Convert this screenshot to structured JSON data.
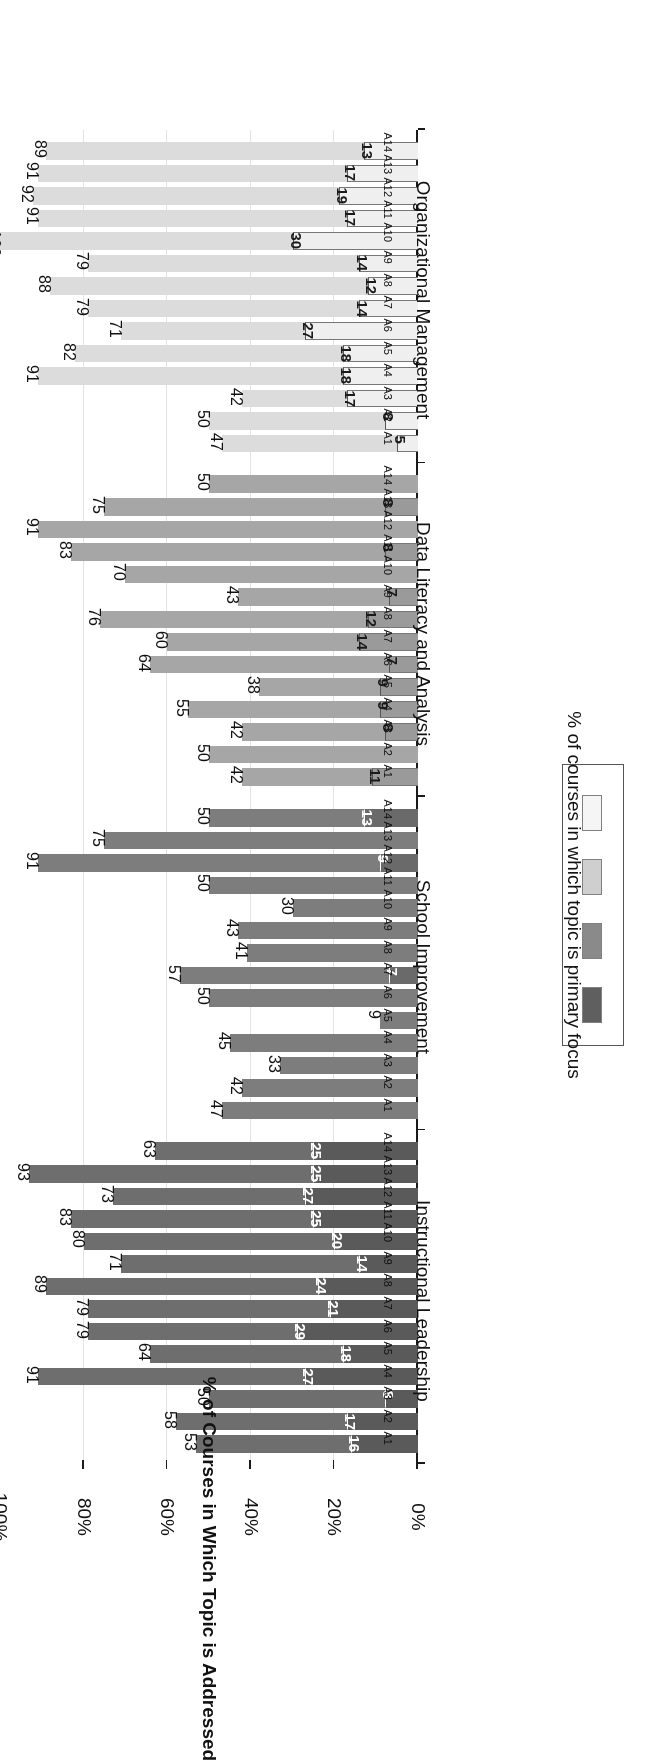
{
  "chart_data": {
    "type": "bar",
    "orientation": "horizontal-grouped",
    "title": "",
    "xlabel": "",
    "ylabel": "% of Courses in Which Topic is Addressed",
    "ylim": [
      0,
      100
    ],
    "ticks": [
      "0%",
      "20%",
      "40%",
      "60%",
      "80%",
      "100%"
    ],
    "tick_values": [
      0,
      20,
      40,
      60,
      80,
      100
    ],
    "grid": true,
    "legend_position": "bottom-right",
    "legend_title": "% of courses in which topic is primary focus",
    "categories": [
      "A1",
      "A2",
      "A3",
      "A4",
      "A5",
      "A6",
      "A7",
      "A8",
      "A9",
      "A10",
      "A11",
      "A12",
      "A13",
      "A14"
    ],
    "groups": [
      {
        "name": "Instructional Leadership",
        "color": "#6e6e6e",
        "inner_color": "#5a5a5a",
        "label_color": "#ffffff",
        "categories": [
          "A1",
          "A2",
          "A3",
          "A4",
          "A5",
          "A6",
          "A7",
          "A8",
          "A9",
          "A10",
          "A11",
          "A12",
          "A13",
          "A14"
        ],
        "values": [
          53,
          58,
          50,
          91,
          64,
          79,
          79,
          89,
          71,
          80,
          83,
          73,
          93,
          63
        ],
        "inner_values": [
          16,
          17,
          8,
          27,
          18,
          29,
          21,
          24,
          14,
          20,
          25,
          27,
          25,
          25
        ]
      },
      {
        "name": "School Improvement",
        "color": "#7d7d7d",
        "inner_color": "#6a6a6a",
        "label_color": "#ffffff",
        "categories": [
          "A1",
          "A2",
          "A3",
          "A4",
          "A5",
          "A6",
          "A7",
          "A8",
          "A9",
          "A10",
          "A11",
          "A12",
          "A13",
          "A14"
        ],
        "values": [
          47,
          42,
          33,
          45,
          9,
          50,
          57,
          41,
          43,
          30,
          50,
          91,
          75,
          50
        ],
        "inner_values": [
          0,
          0,
          0,
          0,
          0,
          0,
          7,
          0,
          0,
          0,
          0,
          9,
          0,
          13
        ]
      },
      {
        "name": "Data Literacy and Analysis",
        "color": "#a6a6a6",
        "inner_color": "#9a9a9a",
        "label_color": "#1a1a1a",
        "categories": [
          "A1",
          "A2",
          "A3",
          "A4",
          "A5",
          "A6",
          "A7",
          "A8",
          "A9",
          "A10",
          "A11",
          "A12",
          "A13",
          "A14"
        ],
        "values": [
          42,
          50,
          42,
          55,
          38,
          64,
          60,
          76,
          43,
          70,
          83,
          91,
          75,
          50
        ],
        "inner_values": [
          11,
          0,
          8,
          9,
          9,
          7,
          14,
          12,
          7,
          0,
          8,
          0,
          8,
          0
        ]
      },
      {
        "name": "Organizational Management",
        "color": "#dcdcdc",
        "inner_color": "#efefef",
        "label_color": "#1a1a1a",
        "categories": [
          "A1",
          "A2",
          "A3",
          "A4",
          "A5",
          "A6",
          "A7",
          "A8",
          "A9",
          "A10",
          "A11",
          "A12",
          "A13",
          "A14"
        ],
        "values": [
          47,
          50,
          42,
          91,
          82,
          71,
          79,
          88,
          79,
          100,
          91,
          92,
          91,
          89
        ],
        "inner_values": [
          5,
          8,
          17,
          18,
          18,
          27,
          14,
          12,
          14,
          30,
          17,
          19,
          17,
          13
        ]
      }
    ],
    "legend_swatches": [
      "#5f5f5f",
      "#8a8a8a",
      "#cfcfcf",
      "#f5f5f5"
    ]
  }
}
